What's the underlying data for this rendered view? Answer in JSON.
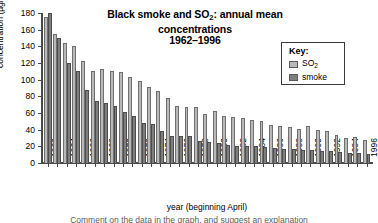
{
  "chart_data": {
    "type": "bar",
    "title": "Black smoke and SO2: annual mean concentrations 1962–1996",
    "title_line1_pre": "Black smoke and SO",
    "title_line1_sub": "2",
    "title_line1_post": ": annual mean concentrations",
    "title_line2": "1962–1996",
    "xlabel": "year (beginning April)",
    "ylabel": "concentration (µg/m³)",
    "ylabel_pre": "concentration (µg/m",
    "ylabel_sup": "3",
    "ylabel_post": ")",
    "ylim": [
      0,
      180
    ],
    "ytick_values": [
      0,
      20,
      40,
      60,
      80,
      100,
      120,
      140,
      160,
      180
    ],
    "ytick_labels": [
      "0",
      "20",
      "40",
      "60",
      "80",
      "100",
      "120",
      "140",
      "160",
      "180"
    ],
    "grid": false,
    "legend_position": "top-right",
    "legend_title": "Key:",
    "categories": [
      "1962",
      "1963",
      "1964",
      "1965",
      "1966",
      "1967",
      "1968",
      "1969",
      "1970",
      "1971",
      "1972",
      "1973",
      "1974",
      "1975",
      "1976",
      "1977",
      "1978",
      "1979",
      "1980",
      "1981",
      "1982",
      "1983",
      "1984",
      "1985",
      "1986",
      "1987",
      "1988",
      "1989",
      "1990",
      "1991",
      "1992",
      "1993",
      "1994",
      "1995",
      "1996"
    ],
    "xtick_labels": [
      "1962",
      "1964",
      "1966",
      "1968",
      "1970",
      "1972",
      "1974",
      "1976",
      "1978",
      "1980",
      "1982",
      "1984",
      "1986",
      "1988",
      "1990",
      "1992",
      "1994",
      "1996"
    ],
    "series": [
      {
        "name": "SO2",
        "name_pre": "SO",
        "name_sub": "2",
        "color": "#b9b9b9",
        "values": [
          175,
          155,
          144,
          141,
          122,
          110,
          113,
          110,
          109,
          103,
          99,
          91,
          86,
          78,
          68,
          67,
          67,
          59,
          62,
          56,
          55,
          54,
          52,
          50,
          46,
          45,
          43,
          41,
          44,
          40,
          38,
          34,
          30,
          31,
          28
        ]
      },
      {
        "name": "smoke",
        "color": "#7e7e7e",
        "values": [
          180,
          150,
          120,
          111,
          88,
          74,
          72,
          69,
          61,
          57,
          48,
          47,
          39,
          33,
          33,
          33,
          26,
          25,
          24,
          22,
          21,
          20,
          20,
          19,
          18,
          17,
          17,
          16,
          16,
          15,
          14,
          13,
          12,
          12,
          11
        ]
      }
    ]
  },
  "caption": "Comment on the data in the graph, and suggest an explanation"
}
